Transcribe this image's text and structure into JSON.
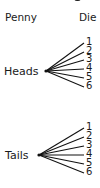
{
  "headers": {
    "penny": "Penny",
    "die": "Die"
  },
  "tree": {
    "level1": [
      {
        "label": "Heads",
        "children": [
          "1",
          "2",
          "3",
          "4",
          "5",
          "6"
        ]
      },
      {
        "label": "Tails",
        "children": [
          "1",
          "2",
          "3",
          "4",
          "5",
          "6"
        ]
      }
    ]
  }
}
